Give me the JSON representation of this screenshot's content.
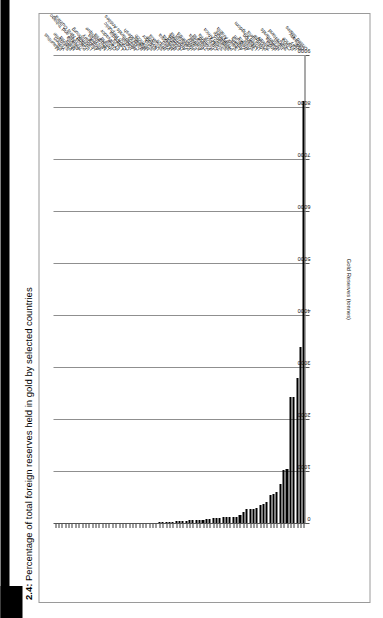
{
  "figure": {
    "number": "2.4:",
    "title": "Percentage of total foreign reserves held in gold by selected countries",
    "full_title": "2.4: Percentage of total foreign reserves held in gold by selected countries"
  },
  "colors": {
    "bar": "#000000",
    "gridline": "#8f8f8f",
    "axis": "#555555",
    "frame": "#9a9a9a",
    "text": "#111111",
    "background": "#ffffff",
    "spine": "#000000"
  },
  "chart_data": {
    "type": "bar",
    "orientation": "horizontal",
    "title": "2.4: Percentage of total foreign reserves held in gold by selected countries",
    "xlabel": "Gold Reserves (tonnes)",
    "ylabel": "",
    "xlim": [
      0,
      9000
    ],
    "xticks": [
      0,
      1000,
      2000,
      3000,
      4000,
      5000,
      6000,
      7000,
      8000,
      9000
    ],
    "xtick_labels": [
      "0",
      "1000",
      "2000",
      "3000",
      "4000",
      "5000",
      "6000",
      "7000",
      "8000",
      "9000"
    ],
    "grid": true,
    "legend": false,
    "categories": [
      "United States",
      "Germany",
      "IMF",
      "Italy",
      "France",
      "China",
      "Switzerland",
      "Japan",
      "Netherlands",
      "Russia",
      "India",
      "Taiwan",
      "Portugal",
      "Venezuela",
      "United Kingdom",
      "Lebanon",
      "Spain",
      "Austria",
      "Belgium",
      "Algeria",
      "Libya",
      "Saudi Arabia",
      "Philippines",
      "Singapore",
      "Sweden",
      "South Africa",
      "Turkey",
      "Greece",
      "Romania",
      "Poland",
      "Thailand",
      "Australia",
      "Kuwait",
      "Egypt",
      "Indonesia",
      "Pakistan",
      "Argentina",
      "Denmark",
      "Finland",
      "Bulgaria",
      "Malaysia",
      "Peru",
      "Brazil",
      "Slovakia",
      "Ukraine",
      "Ecuador",
      "Syria",
      "Morocco",
      "Nigeria",
      "Bangladesh",
      "Cyprus",
      "Netherlands Antilles",
      "Jordan",
      "Czech Republic",
      "Cambodia",
      "Latvia",
      "El Salvador",
      "Qatar",
      "Ireland",
      "Lithuania",
      "Mozambique",
      "Slovenia",
      "Aruba",
      "Hungary",
      "Luxembourg",
      "Iceland",
      "Papua New Guinea",
      "Trinidad and Tobago",
      "Albania",
      "Malta",
      "Estonia",
      "Suriname",
      "Yemen",
      "Fiji",
      "Mauritius"
    ],
    "values": [
      8133,
      3401,
      2814,
      2451,
      2435,
      1054,
      1040,
      765,
      612,
      569,
      557,
      423,
      382,
      363,
      310,
      286,
      281,
      280,
      227,
      173,
      143,
      143,
      127,
      127,
      125,
      124,
      116,
      112,
      103,
      102,
      84,
      79,
      79,
      75,
      73,
      65,
      54,
      66,
      49,
      39,
      36,
      34,
      33,
      31,
      26,
      26,
      25,
      22,
      21,
      13,
      13,
      13,
      12,
      13,
      12,
      7,
      7,
      12,
      6,
      5,
      4,
      3,
      3,
      3,
      2,
      2,
      2,
      1,
      1,
      1,
      1,
      1,
      1,
      1,
      1
    ]
  }
}
